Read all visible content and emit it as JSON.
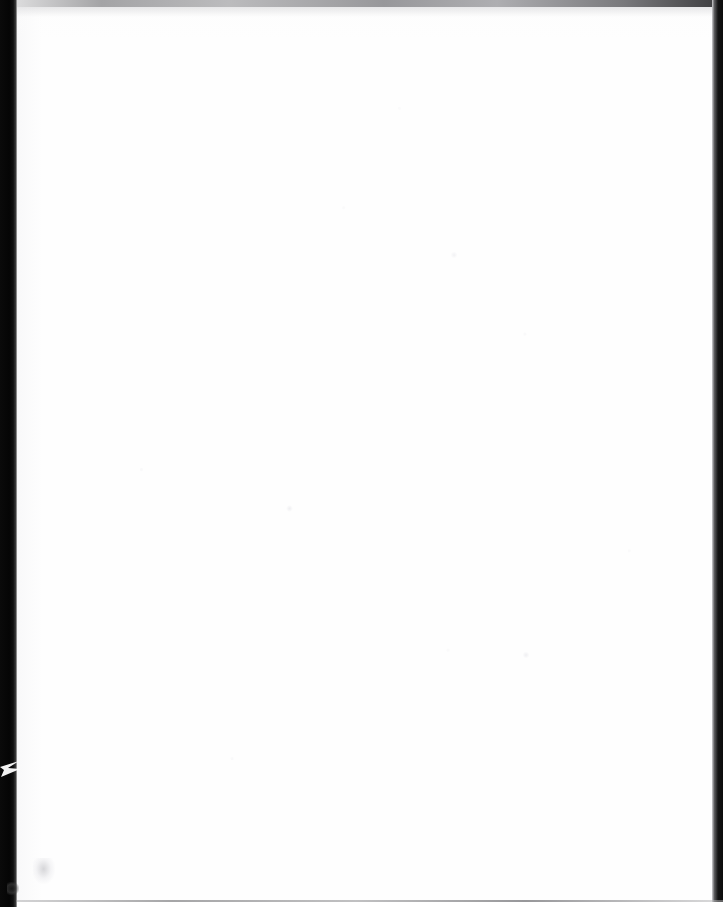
{
  "document": {
    "page_kind": "scanned-blank-page",
    "visible_text": "",
    "body_text_note": "No text, figures, tables or marks are printed on this page.",
    "page_width_px": 723,
    "page_height_px": 907
  },
  "colors": {
    "paper": "#fefefe",
    "binding_shadow": "#050505",
    "top_edge": "#8f8f92",
    "right_edge": "#0b0b0b",
    "bottom_rule": "#9c9c9e",
    "speck_dark": "#191919",
    "smudge": "#c6c6ca"
  },
  "artifacts": {
    "binding_shadow": {
      "name": "left-binding-shadow",
      "left_px": 0,
      "width_px": 17,
      "height_px": 907
    },
    "fold_notch": {
      "name": "fold-notch-wedge",
      "left_px": 0,
      "top_px": 757,
      "width_px": 22,
      "height_px": 22
    },
    "top_edge": {
      "name": "top-scan-edge",
      "top_px": 0,
      "height_px": 7
    },
    "right_edge": {
      "name": "right-scan-edge",
      "left_px": 712,
      "width_px": 11
    },
    "bottom_rule": {
      "name": "bottom-scan-rule",
      "top_px": 900,
      "height_px": 2
    },
    "specks": [
      {
        "name": "corner-dark-speck",
        "left_px": 7,
        "top_px": 882
      },
      {
        "name": "pencil-smudge",
        "left_px": 33,
        "top_px": 858
      },
      {
        "name": "faint-speck-a",
        "left_px": 286,
        "top_px": 505
      },
      {
        "name": "faint-speck-b",
        "left_px": 522,
        "top_px": 652
      },
      {
        "name": "faint-speck-c",
        "left_px": 451,
        "top_px": 251
      }
    ]
  }
}
